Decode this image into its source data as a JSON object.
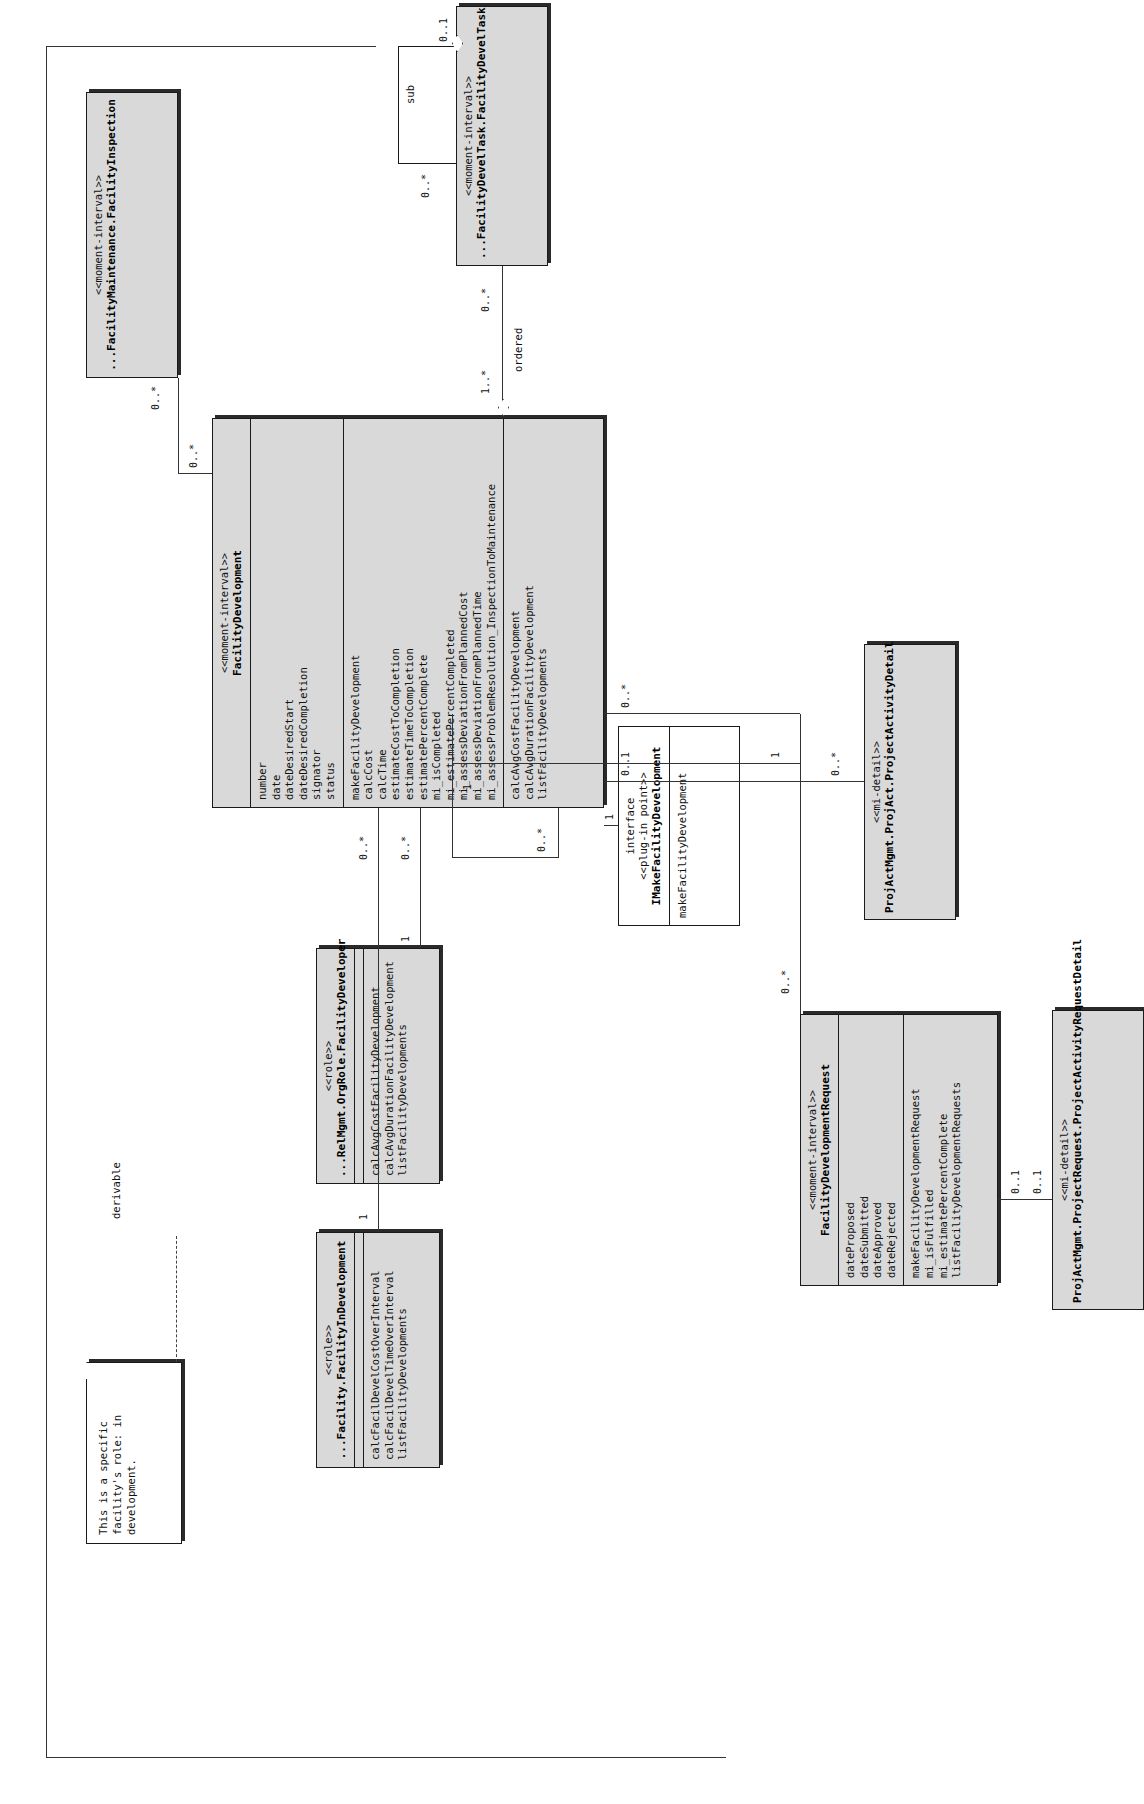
{
  "diagram": {
    "note": {
      "text": "This is a specific facility's role: in development."
    },
    "labels": {
      "derivable": "derivable",
      "ordered": "ordered",
      "sub": "sub"
    },
    "classes": {
      "facility_development": {
        "stereotype": "<<moment-interval>>",
        "name": "FacilityDevelopment",
        "attributes": [
          "number",
          "date",
          "dateDesiredStart",
          "dateDesiredCompletion",
          "signator",
          "status"
        ],
        "operations": [
          "makeFacilityDevelopment",
          "calcCost",
          "calcTime",
          "estimateCostToCompletion",
          "estimateTimeToCompletion",
          "estimatePercentComplete",
          "mi_isCompleted"
        ],
        "operations2": [
          "mi_estimatePercentCompleted",
          "mi_assessDeviationFromPlannedCost",
          "mi_assessDeviationFromPlannedTime",
          "mi_assessProblemResolution_InspectionToMaintenance",
          "calcAvgCostFacilityDevelopment",
          "calcAvgDurationFacilityDevelopment",
          "listFacilityDevelopments"
        ]
      },
      "facility_in_development": {
        "stereotype": "<<role>>",
        "name": "...Facility.FacilityInDevelopment",
        "operations": [
          "calcFacilDevelCostOverInterval",
          "calcFacilDevelTimeOverInterval",
          "listFacilityDevelopments"
        ]
      },
      "facility_developer": {
        "stereotype": "<<role>>",
        "name": "...RelMgmt.OrgRole.FacilityDeveloper",
        "operations": [
          "calcAvgCostFacilityDevelopment",
          "calcAvgDurationFacilityDevelopment",
          "listFacilityDevelopments"
        ]
      },
      "facility_planner": {
        "stereotype": "<<role>>",
        "name": "RelMgmt.PartyRole.FacilityPlanner",
        "operations": [
          "calcAvgCostFacilityDevelopment",
          "calcAvgDurationFacilityDevelopment",
          "listFacilityDevelopmentRequests",
          "listFacilityDevelopments"
        ]
      },
      "facility_inspection": {
        "stereotype": "<<moment-interval>>",
        "name": "...FacilityMaintenance.FacilityInspection",
        "operations": []
      },
      "facility_develtask": {
        "stereotype": "<<moment-interval>>",
        "name": "...FacilityDevelTask.FacilityDevelTask",
        "operations": []
      },
      "facility_development_request": {
        "stereotype": "<<moment-interval>>",
        "name": "FacilityDevelopmentRequest",
        "attributes": [
          "dateProposed",
          "dateSubmitted",
          "dateApproved",
          "dateRejected"
        ],
        "operations": [
          "makeFacilityDevelopmentRequest",
          "mi_isFulfilled",
          "mi_estimatePercentComplete",
          "listFacilityDevelopmentRequests"
        ]
      },
      "project_activity_request_detail": {
        "stereotype": "<<mi-detail>>",
        "name": "ProjActMgmt.ProjectRequest.ProjectActivityRequestDetail",
        "operations": []
      },
      "project_activity_detail": {
        "stereotype": "<<mi-detail>>",
        "name": "ProjActMgmt.ProjAct.ProjectActivityDetail",
        "operations": []
      },
      "make_facility_development": {
        "stereotype_a": "interface",
        "stereotype_b": "<<plug-in point>>",
        "name": "IMakeFacilityDevelopment",
        "operations": [
          "makeFacilityDevelopment"
        ]
      }
    },
    "multiplicities": {
      "m_fid_fd": "1",
      "m_fd_fid": "0..*",
      "m_fdev_fd": "1",
      "m_fd_fdev": "0..*",
      "m_fplan_fd": "1",
      "m_fd_fplan": "0..*",
      "m_fd_insp": "0..*",
      "m_insp_fd": "0..*",
      "m_fd_task": "0..*",
      "m_task_ordered": "1..*",
      "m_task_sub_many": "0..*",
      "m_task_sub_one": "0..1",
      "m_fd_req": "0..*",
      "m_req_fd": "0..*",
      "m_req_plan": "1",
      "m_fd_pad": "0..1",
      "m_pad_fd": "0..*",
      "m_req_prd": "0..1",
      "m_prd_req": "0..1",
      "m_iface_fd": "1",
      "m_fd_iface": "0..1"
    }
  }
}
